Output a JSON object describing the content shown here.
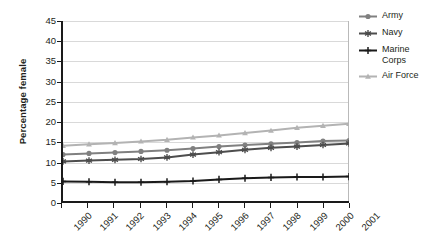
{
  "chart_data": {
    "type": "line",
    "title": "",
    "xlabel": "",
    "ylabel": "Percentage female",
    "ylim": [
      0,
      45
    ],
    "yticks": [
      0,
      5,
      10,
      15,
      20,
      25,
      30,
      35,
      40,
      45
    ],
    "grid": true,
    "legend_position": "right",
    "categories": [
      "1990",
      "1991",
      "1992",
      "1993",
      "1994",
      "1995",
      "1996",
      "1997",
      "1998",
      "1999",
      "2000",
      "2001"
    ],
    "series": [
      {
        "name": "Army",
        "color": "#808080",
        "marker": "circle",
        "values": [
          11.6,
          11.9,
          12.1,
          12.4,
          12.7,
          13.1,
          13.6,
          14.0,
          14.3,
          14.6,
          15.0,
          15.1
        ]
      },
      {
        "name": "Navy",
        "color": "#4d4d4d",
        "marker": "asterisk",
        "values": [
          9.9,
          10.1,
          10.3,
          10.5,
          10.9,
          11.6,
          12.2,
          12.8,
          13.3,
          13.6,
          14.0,
          14.4
        ]
      },
      {
        "name": "Marine Corps",
        "color": "#1a1a1a",
        "marker": "plus",
        "values": [
          4.9,
          4.8,
          4.7,
          4.7,
          4.8,
          5.0,
          5.4,
          5.7,
          5.9,
          6.0,
          6.0,
          6.1
        ]
      },
      {
        "name": "Air Force",
        "color": "#b3b3b3",
        "marker": "triangle",
        "values": [
          13.8,
          14.2,
          14.5,
          14.9,
          15.3,
          15.9,
          16.4,
          17.0,
          17.6,
          18.3,
          18.8,
          19.3
        ]
      }
    ]
  },
  "legend": {
    "entries": [
      {
        "label": "Army"
      },
      {
        "label": "Navy"
      },
      {
        "label": "Marine Corps"
      },
      {
        "label": "Air Force"
      }
    ]
  }
}
